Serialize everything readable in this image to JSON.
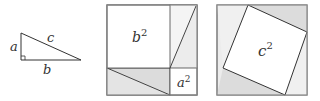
{
  "figure": {
    "triangle": {
      "labels": {
        "a": "a",
        "b": "b",
        "c": "c"
      }
    },
    "square1": {
      "big_label": "b",
      "big_exp": "2",
      "small_label": "a",
      "small_exp": "2"
    },
    "square2": {
      "label": "c",
      "exp": "2"
    },
    "colors": {
      "stroke": "#444444",
      "shade": "#dcdcdc",
      "shade_light": "#ececec",
      "frame": "#999999"
    }
  }
}
